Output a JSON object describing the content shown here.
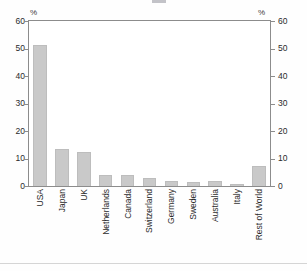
{
  "chart_data": {
    "type": "bar",
    "title": "",
    "subtitle": "",
    "xlabel": "",
    "ylabel": "",
    "unit_label_left": "%",
    "unit_label_right": "%",
    "ylim": [
      0,
      60
    ],
    "yticks": [
      0,
      10,
      20,
      30,
      40,
      50,
      60
    ],
    "ytick_labels": [
      "0",
      "10",
      "20",
      "30",
      "40",
      "50",
      "60"
    ],
    "dual_axis": true,
    "grid": false,
    "legend": null,
    "bar_color": "#c9c9c9",
    "bar_edge_color": "#bdbdbd",
    "axis_color": "#8c8c8c",
    "categories": [
      "USA",
      "Japan",
      "UK",
      "Netherlands",
      "Canada",
      "Switzerland",
      "Germany",
      "Sweden",
      "Australia",
      "Italy",
      "Rest of World"
    ],
    "values": [
      51.2,
      13.3,
      12.3,
      4.1,
      3.9,
      2.9,
      1.9,
      1.6,
      1.8,
      0.7,
      7.1
    ]
  }
}
